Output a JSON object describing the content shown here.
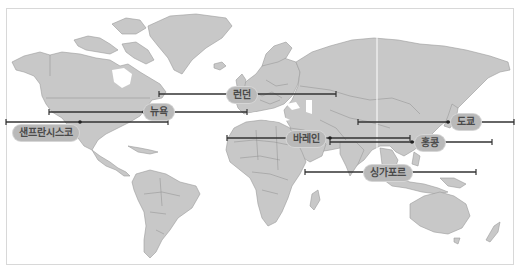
{
  "map": {
    "title": "",
    "land_color": "#c8c8c8",
    "border_color": "#9a9a9a",
    "line_color": "#333333",
    "label_bg": "#b9b9b9",
    "label_text_color": "#4a4a4a"
  },
  "cities": [
    {
      "id": "london",
      "label": "런던",
      "label_x": 242,
      "label_y": 95,
      "line": {
        "y": 94,
        "x1": 159,
        "x2": 336,
        "dot_x": 232
      }
    },
    {
      "id": "new-york",
      "label": "뉴욕",
      "label_x": 159,
      "label_y": 112,
      "line": {
        "y": 112,
        "x1": 49,
        "x2": 247,
        "dot_x": 144
      }
    },
    {
      "id": "san-francisco",
      "label": "샌프란시스코",
      "label_x": 46,
      "label_y": 133,
      "line": {
        "y": 122,
        "x1": 6,
        "x2": 168,
        "dot_x": 80
      }
    },
    {
      "id": "bahrain",
      "label": "바레인",
      "label_x": 306,
      "label_y": 139,
      "line": {
        "y": 138,
        "x1": 227,
        "x2": 410,
        "dot_x": 330
      }
    },
    {
      "id": "tokyo",
      "label": "도쿄",
      "label_x": 466,
      "label_y": 122,
      "line": {
        "y": 122,
        "x1": 358,
        "x2": 514,
        "dot_x": 448
      }
    },
    {
      "id": "hong-kong",
      "label": "홍콩",
      "label_x": 430,
      "label_y": 143,
      "line": {
        "y": 142,
        "x1": 330,
        "x2": 492,
        "dot_x": 412
      }
    },
    {
      "id": "singapore",
      "label": "싱가포르",
      "label_x": 388,
      "label_y": 173,
      "line": {
        "y": 172,
        "x1": 305,
        "x2": 476,
        "dot_x": 398
      }
    }
  ]
}
